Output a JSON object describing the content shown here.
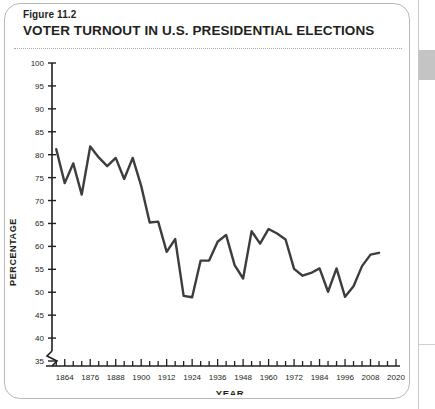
{
  "figure": {
    "number_label": "Figure 11.2",
    "title": "VOTER TURNOUT IN U.S. PRESIDENTIAL ELECTIONS"
  },
  "chart_data": {
    "type": "line",
    "title": "VOTER TURNOUT IN U.S. PRESIDENTIAL ELECTIONS",
    "xlabel": "YEAR",
    "ylabel": "PERCENTAGE",
    "xlim": [
      1858,
      2020
    ],
    "ylim": [
      33,
      100
    ],
    "y_axis_break": true,
    "y_break_below": 35,
    "grid": false,
    "legend": "none",
    "ytick_labels": [
      "35",
      "40",
      "45",
      "50",
      "55",
      "60",
      "65",
      "70",
      "75",
      "80",
      "85",
      "90",
      "95",
      "100"
    ],
    "ytick_values": [
      35,
      40,
      45,
      50,
      55,
      60,
      65,
      70,
      75,
      80,
      85,
      90,
      95,
      100
    ],
    "xtick_labels": [
      "1864",
      "1876",
      "1888",
      "1900",
      "1912",
      "1924",
      "1936",
      "1948",
      "1960",
      "1972",
      "1984",
      "1996",
      "2008",
      "2020"
    ],
    "xtick_values": [
      1864,
      1876,
      1888,
      1900,
      1912,
      1924,
      1936,
      1948,
      1960,
      1972,
      1984,
      1996,
      2008,
      2020
    ],
    "xtick_minor_step": 4,
    "line_color": "#3d3d3d",
    "line_width": 2.4,
    "x": [
      1860,
      1864,
      1868,
      1872,
      1876,
      1880,
      1884,
      1888,
      1892,
      1896,
      1900,
      1904,
      1908,
      1912,
      1916,
      1920,
      1924,
      1928,
      1932,
      1936,
      1940,
      1944,
      1948,
      1952,
      1956,
      1960,
      1964,
      1968,
      1972,
      1976,
      1980,
      1984,
      1988,
      1992,
      1996,
      2000,
      2004,
      2008,
      2012
    ],
    "values": [
      81.2,
      73.8,
      78.1,
      71.3,
      81.8,
      79.4,
      77.5,
      79.3,
      74.7,
      79.3,
      73.2,
      65.2,
      65.4,
      58.8,
      61.6,
      49.2,
      48.9,
      56.9,
      56.9,
      61.0,
      62.5,
      55.9,
      53.0,
      63.3,
      60.6,
      63.8,
      62.8,
      61.5,
      55.1,
      53.6,
      54.2,
      55.2,
      50.1,
      55.2,
      49.0,
      51.3,
      55.7,
      58.2,
      58.6
    ],
    "notes": {
      "max_value": 81.8,
      "max_year": 1876,
      "min_value": 48.9,
      "min_year": 1924
    }
  }
}
